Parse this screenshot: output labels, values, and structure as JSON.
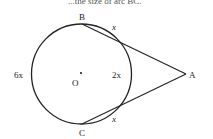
{
  "colors": {
    "stroke": "#222222",
    "background": "#ffffff"
  },
  "top_text": "...the size of arc BC.",
  "diagram": {
    "circle": {
      "center_label": "O"
    },
    "points": {
      "B": "B",
      "C": "C",
      "A": "A",
      "O": "O"
    },
    "arc_labels": {
      "major_arc": "6x",
      "minor_arc": "2x",
      "upper_segment": "x",
      "lower_segment": "x"
    }
  }
}
